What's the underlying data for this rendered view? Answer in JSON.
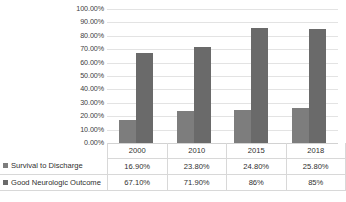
{
  "chart_data": {
    "type": "bar",
    "title": "",
    "subtitle": "",
    "xlabel": "",
    "ylabel": "",
    "categories": [
      "2000",
      "2010",
      "2015",
      "2018"
    ],
    "series": [
      {
        "name": "Survival to Discharge",
        "color": "#7d7d7d",
        "values": [
          16.9,
          23.8,
          24.8,
          25.8
        ],
        "labels": [
          "16.90%",
          "23.80%",
          "24.80%",
          "25.80%"
        ]
      },
      {
        "name": "Good Neurologic Outcome",
        "color": "#6a6a6a",
        "values": [
          67.1,
          71.9,
          86,
          85
        ],
        "labels": [
          "67.10%",
          "71.90%",
          "86%",
          "85%"
        ]
      }
    ],
    "ylim": [
      0,
      100
    ],
    "ytick_values": [
      100,
      90,
      80,
      70,
      60,
      50,
      40,
      30,
      20,
      10,
      0
    ],
    "ytick_labels": [
      "100.00%",
      "90.00%",
      "80.00%",
      "70.00%",
      "60.00%",
      "50.00%",
      "40.00%",
      "30.00%",
      "20.00%",
      "10.00%",
      "0.00%"
    ],
    "grid": true,
    "grid_color": "#e3e3e3",
    "legend_position": "table-left",
    "data_table_visible": true,
    "plot_background": "#ffffff"
  }
}
